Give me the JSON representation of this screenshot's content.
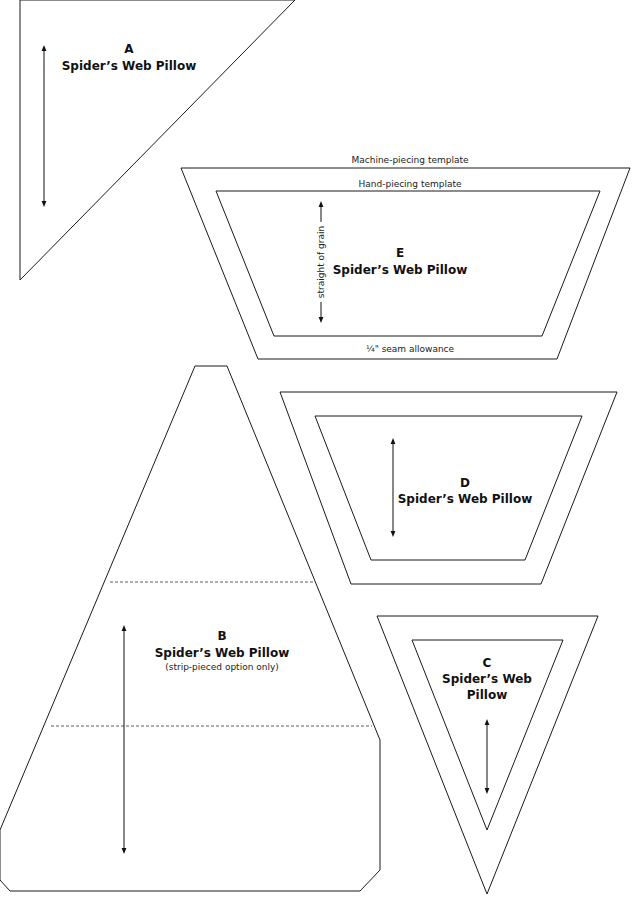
{
  "colors": {
    "line": "#1a1a1a",
    "background": "#ffffff"
  },
  "templates": {
    "A": {
      "letter": "A",
      "name": "Spider’s Web Pillow"
    },
    "B": {
      "letter": "B",
      "name": "Spider’s Web Pillow",
      "note": "(strip-pieced option only)"
    },
    "C": {
      "letter": "C",
      "name_line1": "Spider’s Web",
      "name_line2": "Pillow"
    },
    "D": {
      "letter": "D",
      "name": "Spider’s Web Pillow"
    },
    "E": {
      "letter": "E",
      "name": "Spider’s Web Pillow",
      "machine_label": "Machine-piecing template",
      "hand_label": "Hand-piecing template",
      "seam_label": "¼\" seam allowance",
      "grain_label": "straight of grain"
    }
  }
}
